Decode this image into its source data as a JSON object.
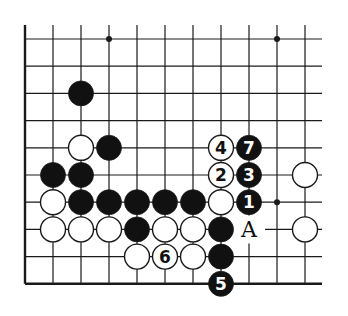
{
  "diagram": {
    "type": "go-board-fragment",
    "background": "#ffffff",
    "line_color": "#1a1a1a",
    "black_stone_color": "#111111",
    "white_stone_color": "#ffffff",
    "grid": {
      "columns": 11,
      "rows": 10,
      "origin_x": 25,
      "origin_y": 39,
      "spacing_x": 28.0,
      "spacing_y": 27.2,
      "left_edge": true,
      "bottom_edge": true,
      "top_extension_to_y": 25,
      "right_extension_to_x": 322
    },
    "star_points": [
      {
        "col": 3,
        "row": 0
      },
      {
        "col": 9,
        "row": 0
      },
      {
        "col": 9,
        "row": 6
      }
    ],
    "stones": [
      {
        "color": "black",
        "col": 2,
        "row": 2,
        "label": ""
      },
      {
        "color": "white",
        "col": 2,
        "row": 4,
        "label": ""
      },
      {
        "color": "black",
        "col": 3,
        "row": 4,
        "label": ""
      },
      {
        "color": "white",
        "col": 7,
        "row": 4,
        "label": "4"
      },
      {
        "color": "black",
        "col": 8,
        "row": 4,
        "label": "7"
      },
      {
        "color": "black",
        "col": 1,
        "row": 5,
        "label": ""
      },
      {
        "color": "black",
        "col": 2,
        "row": 5,
        "label": ""
      },
      {
        "color": "white",
        "col": 7,
        "row": 5,
        "label": "2"
      },
      {
        "color": "black",
        "col": 8,
        "row": 5,
        "label": "3"
      },
      {
        "color": "white",
        "col": 10,
        "row": 5,
        "label": ""
      },
      {
        "color": "white",
        "col": 1,
        "row": 6,
        "label": ""
      },
      {
        "color": "black",
        "col": 2,
        "row": 6,
        "label": ""
      },
      {
        "color": "black",
        "col": 3,
        "row": 6,
        "label": ""
      },
      {
        "color": "black",
        "col": 4,
        "row": 6,
        "label": ""
      },
      {
        "color": "black",
        "col": 5,
        "row": 6,
        "label": ""
      },
      {
        "color": "black",
        "col": 6,
        "row": 6,
        "label": ""
      },
      {
        "color": "white",
        "col": 7,
        "row": 6,
        "label": ""
      },
      {
        "color": "black",
        "col": 8,
        "row": 6,
        "label": "1"
      },
      {
        "color": "white",
        "col": 1,
        "row": 7,
        "label": ""
      },
      {
        "color": "white",
        "col": 2,
        "row": 7,
        "label": ""
      },
      {
        "color": "white",
        "col": 3,
        "row": 7,
        "label": ""
      },
      {
        "color": "black",
        "col": 4,
        "row": 7,
        "label": ""
      },
      {
        "color": "white",
        "col": 5,
        "row": 7,
        "label": ""
      },
      {
        "color": "white",
        "col": 6,
        "row": 7,
        "label": ""
      },
      {
        "color": "black",
        "col": 7,
        "row": 7,
        "label": ""
      },
      {
        "color": "white",
        "col": 10,
        "row": 7,
        "label": ""
      },
      {
        "color": "white",
        "col": 4,
        "row": 8,
        "label": ""
      },
      {
        "color": "white",
        "col": 5,
        "row": 8,
        "label": "6"
      },
      {
        "color": "white",
        "col": 6,
        "row": 8,
        "label": ""
      },
      {
        "color": "black",
        "col": 7,
        "row": 8,
        "label": ""
      },
      {
        "color": "black",
        "col": 7,
        "row": 9,
        "label": "5"
      }
    ],
    "point_labels": [
      {
        "text": "A",
        "col": 8,
        "row": 7
      }
    ]
  }
}
